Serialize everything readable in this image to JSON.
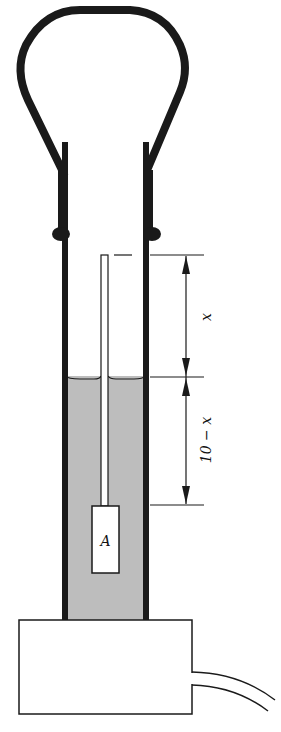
{
  "diagram": {
    "labels": {
      "upper_dimension": "x",
      "lower_dimension": "10 − x",
      "block": "A"
    },
    "colors": {
      "ink": "#1a1a1a",
      "liquid": "#bdbdbd",
      "background": "#ffffff"
    }
  }
}
